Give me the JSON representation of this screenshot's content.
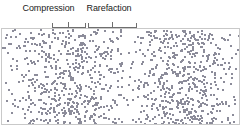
{
  "figure": {
    "width": 242,
    "height": 134,
    "background_color": "#ffffff"
  },
  "annotations": {
    "compression": {
      "label": "Compression",
      "bracket_name": "compression-bracket"
    },
    "rarefaction": {
      "label": "Rarefaction",
      "bracket_name": "rarefaction-bracket"
    },
    "line_color": "#6e6e6e",
    "text_color": "#1a1a1a"
  },
  "chart_data": {
    "type": "scatter",
    "xlabel": "",
    "ylabel": "",
    "grid": false,
    "legend": "none",
    "panel": {
      "x": 1,
      "y": 28,
      "width": 239,
      "height": 97,
      "border_color": "#c9c9c9"
    },
    "dot": {
      "color": "#8c8c9a",
      "size_px": 2,
      "shape": "square",
      "count": 1150
    },
    "density_profile": {
      "form": "1 + amplitude * cos(2*pi*(x - phase)/wavelength)",
      "amplitude": 0.62,
      "wavelength_px": 115,
      "phase_px": 68,
      "xlim": [
        0,
        242
      ],
      "ylim": [
        28,
        125
      ]
    },
    "compressions_center_x": [
      68,
      183
    ],
    "rarefactions_center_x": [
      112,
      227
    ],
    "annotated_regions": [
      {
        "name": "Compression",
        "x_start": 52,
        "x_end": 86,
        "tick_x": 68
      },
      {
        "name": "Rarefaction",
        "x_start": 88,
        "x_end": 137,
        "tick_x": 112
      }
    ]
  }
}
